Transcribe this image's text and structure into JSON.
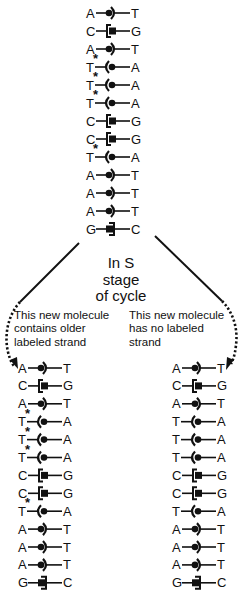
{
  "center_label": {
    "lines": [
      "In S",
      "stage",
      "of cycle"
    ]
  },
  "left_note": {
    "lines": [
      "This new molecule",
      "contains older",
      "labeled strand"
    ]
  },
  "right_note": {
    "lines": [
      "This new molecule",
      "has no labeled",
      "strand"
    ]
  },
  "pair_symbols": {
    "A-T": "dot-left, arc-right",
    "T-A": "arc-left, dot-right",
    "C-G": "bracket-left, square-right",
    "G-C": "square-left, bracket-right"
  },
  "molecules": [
    {
      "id": "parent",
      "x": 86,
      "y0": 13,
      "dy": 18,
      "pairs": [
        [
          "A",
          "T"
        ],
        [
          "C",
          "G"
        ],
        [
          "A",
          "T"
        ],
        [
          "T",
          "A"
        ],
        [
          "T",
          "A"
        ],
        [
          "T",
          "A"
        ],
        [
          "C",
          "G"
        ],
        [
          "C",
          "G"
        ],
        [
          "T",
          "A"
        ],
        [
          "A",
          "T"
        ],
        [
          "A",
          "T"
        ],
        [
          "A",
          "T"
        ],
        [
          "G",
          "C"
        ]
      ],
      "labeled_rows": [
        3,
        4,
        5,
        8
      ]
    },
    {
      "id": "daughter-labeled",
      "x": 18,
      "y0": 368,
      "dy": 17.9,
      "pairs": [
        [
          "A",
          "T"
        ],
        [
          "C",
          "G"
        ],
        [
          "A",
          "T"
        ],
        [
          "T",
          "A"
        ],
        [
          "T",
          "A"
        ],
        [
          "T",
          "A"
        ],
        [
          "C",
          "G"
        ],
        [
          "C",
          "G"
        ],
        [
          "T",
          "A"
        ],
        [
          "A",
          "T"
        ],
        [
          "A",
          "T"
        ],
        [
          "A",
          "T"
        ],
        [
          "G",
          "C"
        ]
      ],
      "labeled_rows": [
        3,
        4,
        5,
        8
      ]
    },
    {
      "id": "daughter-unlabeled",
      "x": 172,
      "y0": 368,
      "dy": 17.9,
      "pairs": [
        [
          "A",
          "T"
        ],
        [
          "C",
          "G"
        ],
        [
          "A",
          "T"
        ],
        [
          "T",
          "A"
        ],
        [
          "T",
          "A"
        ],
        [
          "T",
          "A"
        ],
        [
          "C",
          "G"
        ],
        [
          "C",
          "G"
        ],
        [
          "T",
          "A"
        ],
        [
          "A",
          "T"
        ],
        [
          "A",
          "T"
        ],
        [
          "A",
          "T"
        ],
        [
          "G",
          "C"
        ]
      ],
      "labeled_rows": []
    }
  ],
  "label_marker": "*"
}
